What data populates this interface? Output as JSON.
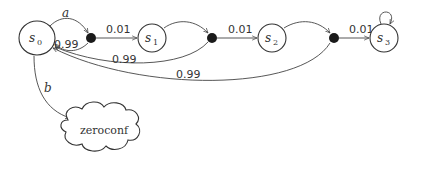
{
  "diagram": {
    "type": "markov-chain",
    "states": [
      {
        "id": "s0",
        "label": "s",
        "subscript": "0"
      },
      {
        "id": "s1",
        "label": "s",
        "subscript": "1"
      },
      {
        "id": "s2",
        "label": "s",
        "subscript": "2"
      },
      {
        "id": "s3",
        "label": "s",
        "subscript": "3"
      }
    ],
    "terminal": {
      "id": "zeroconf",
      "label": "zeroconf"
    },
    "edges": [
      {
        "from": "s0",
        "to": "dot1",
        "label": "a"
      },
      {
        "from": "dot1",
        "to": "s0",
        "label": "0.99"
      },
      {
        "from": "dot1",
        "to": "s1",
        "label": "0.01"
      },
      {
        "from": "s1",
        "to": "dot2",
        "label": ""
      },
      {
        "from": "dot2",
        "to": "s0",
        "label": "0.99"
      },
      {
        "from": "dot2",
        "to": "s2",
        "label": "0.01"
      },
      {
        "from": "s2",
        "to": "dot3",
        "label": ""
      },
      {
        "from": "dot3",
        "to": "s0",
        "label": "0.99"
      },
      {
        "from": "dot3",
        "to": "s3",
        "label": "0.01"
      },
      {
        "from": "s3",
        "to": "s3",
        "label": ""
      },
      {
        "from": "s0",
        "to": "zeroconf",
        "label": "b"
      }
    ]
  }
}
